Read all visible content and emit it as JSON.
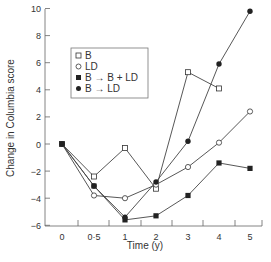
{
  "chart_data": {
    "type": "line",
    "title": "",
    "xlabel": "Time (y)",
    "ylabel": "Change in Columbia score",
    "ylim": [
      -6,
      10
    ],
    "yticks": [
      10,
      8,
      6,
      4,
      2,
      0,
      -2,
      -4,
      -6
    ],
    "yticklabels": [
      "10",
      "8",
      "6",
      "4",
      "2",
      "0",
      "−2",
      "−4",
      "−6"
    ],
    "xticks": [
      0,
      0.5,
      1,
      2,
      3,
      4,
      5
    ],
    "xticklabels": [
      "0",
      "0·5",
      "1",
      "2",
      "3",
      "4",
      "5"
    ],
    "grid": false,
    "legend_position": "upper left (inside)",
    "series": [
      {
        "name": "B",
        "marker": "open-square",
        "x": [
          0,
          0.5,
          1,
          2,
          3,
          4
        ],
        "values": [
          0,
          -2.4,
          -0.3,
          -3.3,
          5.3,
          4.1
        ]
      },
      {
        "name": "LD",
        "marker": "open-circle",
        "x": [
          0,
          0.5,
          1,
          2,
          3,
          4,
          5
        ],
        "values": [
          0,
          -3.8,
          -4.0,
          -3.0,
          -1.7,
          0.1,
          2.4
        ]
      },
      {
        "name": "B → B + LD",
        "marker": "filled-square",
        "x": [
          0,
          0.5,
          1,
          2,
          3,
          4,
          5
        ],
        "values": [
          0,
          -3.1,
          -5.6,
          -5.3,
          -3.8,
          -1.4,
          -1.8
        ]
      },
      {
        "name": "B → LD",
        "marker": "filled-circle",
        "x": [
          0,
          0.5,
          1,
          2,
          3,
          4,
          5
        ],
        "values": [
          0,
          -3.1,
          -5.4,
          -2.8,
          0.2,
          5.9,
          9.8
        ]
      }
    ]
  },
  "legend": {
    "items": [
      "B",
      "LD",
      "B → B + LD",
      "B → LD"
    ]
  }
}
